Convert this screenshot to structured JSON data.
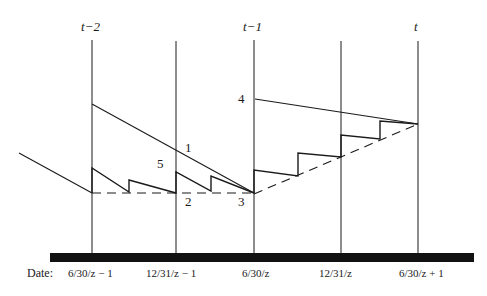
{
  "diagram": {
    "period_labels": [
      "t−2",
      "t−1",
      "t"
    ],
    "point_labels": [
      "1",
      "2",
      "3",
      "4",
      "5"
    ],
    "axis": {
      "title": "Date:",
      "dates": [
        "6/30/z − 1",
        "12/31/z − 1",
        "6/30/z",
        "12/31/z",
        "6/30/z + 1"
      ]
    },
    "colors": {
      "line": "#1a1a1a",
      "axis_bar": "#111111",
      "background": "#ffffff"
    }
  }
}
